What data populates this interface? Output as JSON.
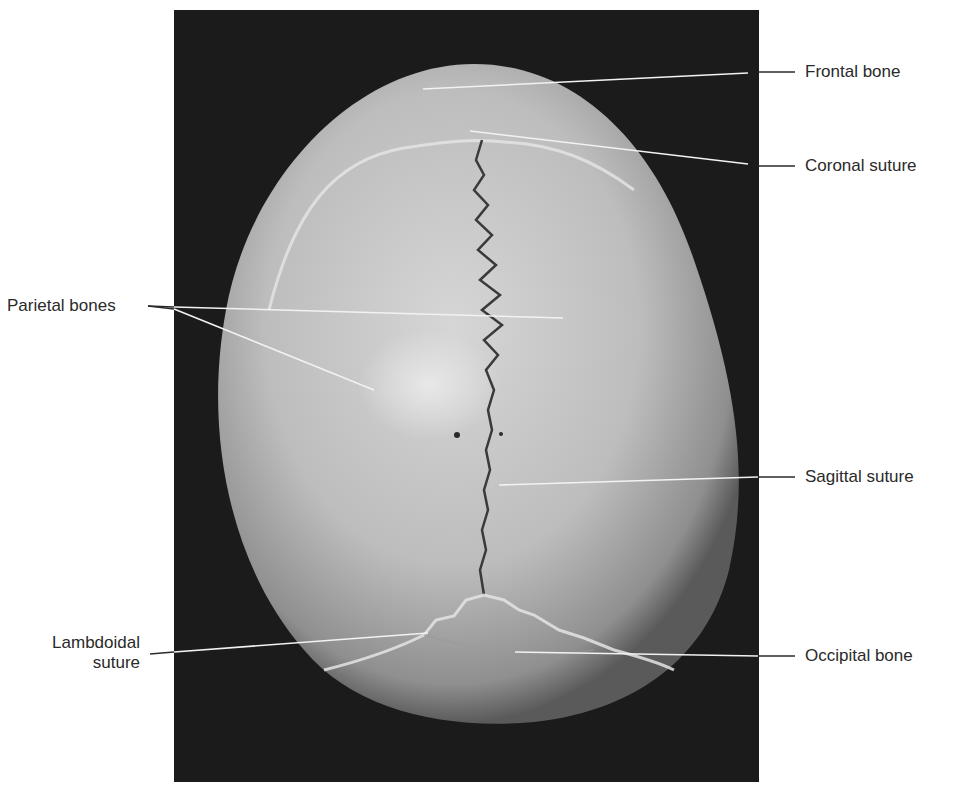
{
  "figure": {
    "background_color": "#ffffff",
    "photo_background": "#1b1b1b",
    "bone_color": "#c8c8c8",
    "suture_color": "#3a3a3a",
    "leader_line_color": "#f2f2f2",
    "label_color": "#2a2a2a"
  },
  "labels": {
    "frontal_bone": "Frontal bone",
    "coronal_suture": "Coronal suture",
    "parietal_bones": "Parietal bones",
    "sagittal_suture": "Sagittal suture",
    "lambdoidal_suture_line1": "Lambdoidal",
    "lambdoidal_suture_line2": "suture",
    "occipital_bone": "Occipital bone"
  }
}
